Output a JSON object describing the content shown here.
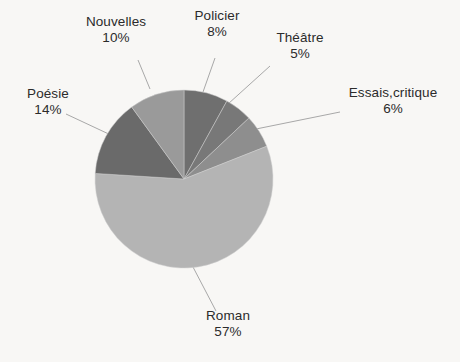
{
  "chart_data": {
    "type": "pie",
    "title": "",
    "subtitle": "",
    "xlabel": "",
    "ylabel": "",
    "legend_position": "none",
    "grid": false,
    "labels_outside": true,
    "leader_lines": true,
    "start_angle_deg": 0,
    "direction": "clockwise",
    "categories": [
      "Policier",
      "Théâtre",
      "Essais,critique",
      "Roman",
      "Poésie",
      "Nouvelles"
    ],
    "values": [
      8,
      5,
      6,
      57,
      14,
      10
    ],
    "value_suffix": "%",
    "slices": [
      {
        "label": "Policier",
        "value": 8,
        "display": "8%",
        "color": "#6f6f6f",
        "label_id": "lbl-policier"
      },
      {
        "label": "Théâtre",
        "value": 5,
        "display": "5%",
        "color": "#787878",
        "label_id": "lbl-theatre"
      },
      {
        "label": "Essais,critique",
        "value": 6,
        "display": "6%",
        "color": "#8e8e8e",
        "label_id": "lbl-essais"
      },
      {
        "label": "Roman",
        "value": 57,
        "display": "57%",
        "color": "#b4b4b4",
        "label_id": "lbl-roman"
      },
      {
        "label": "Poésie",
        "value": 14,
        "display": "14%",
        "color": "#6a6a6a",
        "label_id": "lbl-poesie"
      },
      {
        "label": "Nouvelles",
        "value": 10,
        "display": "10%",
        "color": "#9a9a9a",
        "label_id": "lbl-nouvelles"
      }
    ],
    "geometry": {
      "center_x": 184,
      "center_y": 179,
      "radius": 89
    },
    "colors": {
      "background": "#f8f7f5",
      "text": "#2b2b2b",
      "leader_line": "#a8a8a8",
      "slice_edge": "#cfcfcf"
    }
  },
  "labels": {
    "nouvelles": {
      "name": "Nouvelles",
      "percent": "10%"
    },
    "policier": {
      "name": "Policier",
      "percent": "8%"
    },
    "theatre": {
      "name": "Théâtre",
      "percent": "5%"
    },
    "essais": {
      "name": "Essais,critique",
      "percent": "6%"
    },
    "poesie": {
      "name": "Poésie",
      "percent": "14%"
    },
    "roman": {
      "name": "Roman",
      "percent": "57%"
    }
  }
}
